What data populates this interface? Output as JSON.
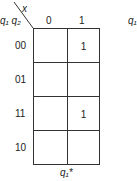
{
  "kmap": {
    "col_var": "x",
    "row_vars": "q₁ q₂",
    "col_headers": [
      "0",
      "1"
    ],
    "row_headers": [
      "00",
      "01",
      "11",
      "10"
    ],
    "cells": [
      [
        "",
        "1"
      ],
      [
        "",
        ""
      ],
      [
        "",
        "1"
      ],
      [
        "",
        ""
      ]
    ],
    "output_label": "q₁*",
    "partial_next_label": "q₁"
  }
}
